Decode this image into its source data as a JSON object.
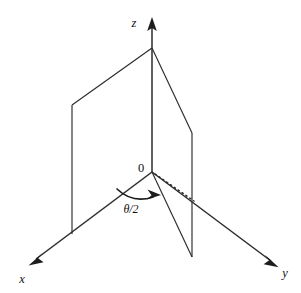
{
  "figure": {
    "type": "geometry-diagram-3d",
    "background_color": "#ffffff",
    "line_color": "#2b2b2b",
    "accent_color": "#1d1d1d"
  },
  "axes": {
    "z": {
      "label": "z",
      "label_x": 134,
      "label_y": 27,
      "arrow_tip_x": 152,
      "arrow_tip_y": 18
    },
    "x": {
      "label": "x",
      "label_x": 20,
      "label_y": 282,
      "arrow_tip_x": 29,
      "arrow_tip_y": 265
    },
    "y": {
      "label": "y",
      "label_x": 282,
      "label_y": 277,
      "arrow_tip_x": 278,
      "arrow_tip_y": 267
    }
  },
  "origin": {
    "label": "0",
    "x": 152,
    "y": 172,
    "label_x": 139,
    "label_y": 169
  },
  "apex": {
    "x": 152,
    "y": 48
  },
  "planes": {
    "left": {
      "name": "left-half-plane",
      "points": "152,48 72,105 72,234 152,172"
    },
    "right": {
      "name": "right-half-plane",
      "points": "152,48 192,133 192,257 152,172"
    }
  },
  "bisector": {
    "name": "bisector-dotted-ray",
    "from_x": 152,
    "from_y": 172,
    "to_x": 194,
    "to_y": 201
  },
  "angle": {
    "label": "θ/2",
    "label_x": 129,
    "label_y": 211,
    "arc_path": "M 117 189 Q 131 203 155 198",
    "arrow_tip_x": 160,
    "arrow_tip_y": 196
  }
}
